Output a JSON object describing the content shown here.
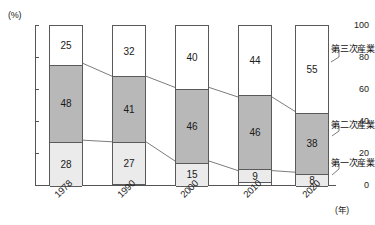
{
  "chart_data": {
    "type": "bar",
    "subtype": "stacked-bar-100",
    "title": "",
    "xlabel": "",
    "ylabel": "",
    "y_unit": "(%)",
    "x_unit": "(年)",
    "ylim": [
      0,
      100
    ],
    "yticks": [
      100,
      80,
      60,
      40,
      20,
      0
    ],
    "grid": false,
    "legend_position": "right",
    "categories": [
      "1978",
      "1990",
      "2000",
      "2010",
      "2020"
    ],
    "series": [
      {
        "name": "第一次産業",
        "values": [
          28,
          27,
          15,
          9,
          8
        ],
        "color": "#ebebeb"
      },
      {
        "name": "第二次産業",
        "values": [
          48,
          41,
          46,
          46,
          38
        ],
        "color": "#b8b8b8"
      },
      {
        "name": "第三次産業",
        "values": [
          25,
          32,
          40,
          44,
          55
        ],
        "color": "#ffffff"
      }
    ],
    "annotations": {
      "connectors": "lines linking stacked segment boundaries between adjacent bars"
    }
  },
  "axes": {
    "y_unit_label": "(%)",
    "x_unit_label": "(年)",
    "ytick_labels": [
      "100",
      "80",
      "60",
      "40",
      "20",
      "0"
    ],
    "xtick_labels": [
      "1978",
      "1990",
      "2000",
      "2010",
      "2020"
    ]
  },
  "legend": {
    "tertiary": "第三次産業",
    "secondary": "第二次産業",
    "primary": "第一次産業"
  },
  "bar_labels": {
    "b1978": {
      "tertiary": "25",
      "secondary": "48",
      "primary": "28"
    },
    "b1990": {
      "tertiary": "32",
      "secondary": "41",
      "primary": "27"
    },
    "b2000": {
      "tertiary": "40",
      "secondary": "46",
      "primary": "15"
    },
    "b2010": {
      "tertiary": "44",
      "secondary": "46",
      "primary": "9"
    },
    "b2020": {
      "tertiary": "55",
      "secondary": "38",
      "primary": "8"
    }
  },
  "title_sliver": ""
}
